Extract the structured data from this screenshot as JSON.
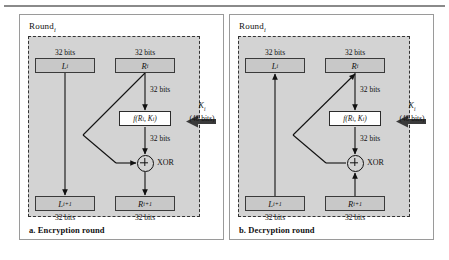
{
  "figure": {
    "colors": {
      "panel_border": "#9a9a9a",
      "dashed_region_fill": "#d3d3d3",
      "data_block_fill": "#c8c8c8",
      "data_block_border": "#3a3a3a",
      "function_box_fill": "#ffffff",
      "key_arrow": "#3a3a3a",
      "wire": "#111111"
    }
  },
  "panels": [
    {
      "id": "encryption",
      "round_label": "Round",
      "round_sub": "i",
      "caption": "a. Encryption round",
      "top_left_block": {
        "label": "L",
        "sub": "i",
        "bits": "32 bits"
      },
      "top_right_block": {
        "label": "R",
        "sub": "i",
        "bits": "32 bits"
      },
      "bottom_left_block": {
        "label": "L",
        "sub": "i+1",
        "bits": "32 bits"
      },
      "bottom_right_block": {
        "label": "R",
        "sub": "i+1",
        "bits": "32 bits"
      },
      "function_box": {
        "text": "f(R",
        "sub1": "i",
        "mid": ", K",
        "sub2": "i",
        "close": ")"
      },
      "mid_bits": "32 bits",
      "lower_bits": "32 bits",
      "xor_label": "XOR",
      "key": {
        "name": "K",
        "sub": "i",
        "size": "(48 bits)"
      }
    },
    {
      "id": "decryption",
      "round_label": "Round",
      "round_sub": "i",
      "caption": "b. Decryption round",
      "top_left_block": {
        "label": "L",
        "sub": "i",
        "bits": "32 bits"
      },
      "top_right_block": {
        "label": "R",
        "sub": "i",
        "bits": "32 bits"
      },
      "bottom_left_block": {
        "label": "L",
        "sub": "i+1",
        "bits": "32 bits"
      },
      "bottom_right_block": {
        "label": "R",
        "sub": "i+1",
        "bits": "32 bits"
      },
      "function_box": {
        "text": "f(R",
        "sub1": "i",
        "mid": ", K",
        "sub2": "i",
        "close": ")"
      },
      "mid_bits": "32 bits",
      "lower_bits": "32 bits",
      "xor_label": "XOR",
      "key": {
        "name": "K",
        "sub": "i",
        "size": "(48 bits)"
      }
    }
  ]
}
